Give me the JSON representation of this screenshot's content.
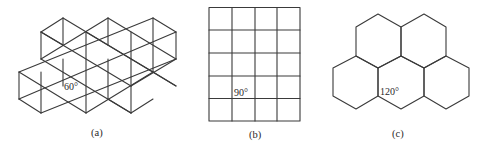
{
  "figure": {
    "panels": [
      {
        "id": "a",
        "caption": "(a)",
        "tiling": "triangular",
        "angle_label": "60°",
        "description": "Triangular tessellation arranged as overlapping hexagonal rosettes"
      },
      {
        "id": "b",
        "caption": "(b)",
        "tiling": "square",
        "angle_label": "90°",
        "columns": 4,
        "rows": 5
      },
      {
        "id": "c",
        "caption": "(c)",
        "tiling": "hexagonal",
        "angle_label": "120°",
        "hexagon_count": 5
      }
    ]
  },
  "colors": {
    "line": "#3a3a3a",
    "text": "#2a2a2a",
    "background": "#ffffff"
  }
}
